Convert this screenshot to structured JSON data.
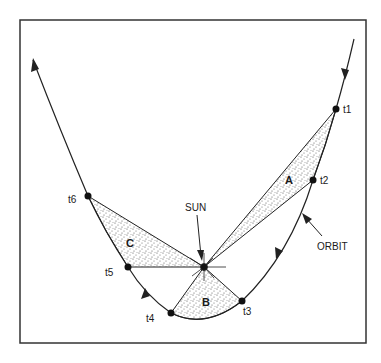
{
  "diagram": {
    "type": "orbit-equal-areas",
    "colors": {
      "stroke": "#222222",
      "stipple": "#555555",
      "background": "#ffffff"
    },
    "sun": {
      "label": "SUN",
      "x": 204,
      "y": 267
    },
    "orbit_label": "ORBIT",
    "points": [
      {
        "id": "t1",
        "label": "t1",
        "x": 336,
        "y": 109
      },
      {
        "id": "t2",
        "label": "t2",
        "x": 313,
        "y": 180
      },
      {
        "id": "t3",
        "label": "t3",
        "x": 242,
        "y": 301
      },
      {
        "id": "t4",
        "label": "t4",
        "x": 171,
        "y": 313
      },
      {
        "id": "t5",
        "label": "t5",
        "x": 128,
        "y": 267
      },
      {
        "id": "t6",
        "label": "t6",
        "x": 88,
        "y": 196
      }
    ],
    "regions": [
      {
        "id": "A",
        "label": "A",
        "between": [
          "t1",
          "t2"
        ]
      },
      {
        "id": "B",
        "label": "B",
        "between": [
          "t3",
          "t4"
        ]
      },
      {
        "id": "C",
        "label": "C",
        "between": [
          "t5",
          "t6"
        ]
      }
    ]
  }
}
